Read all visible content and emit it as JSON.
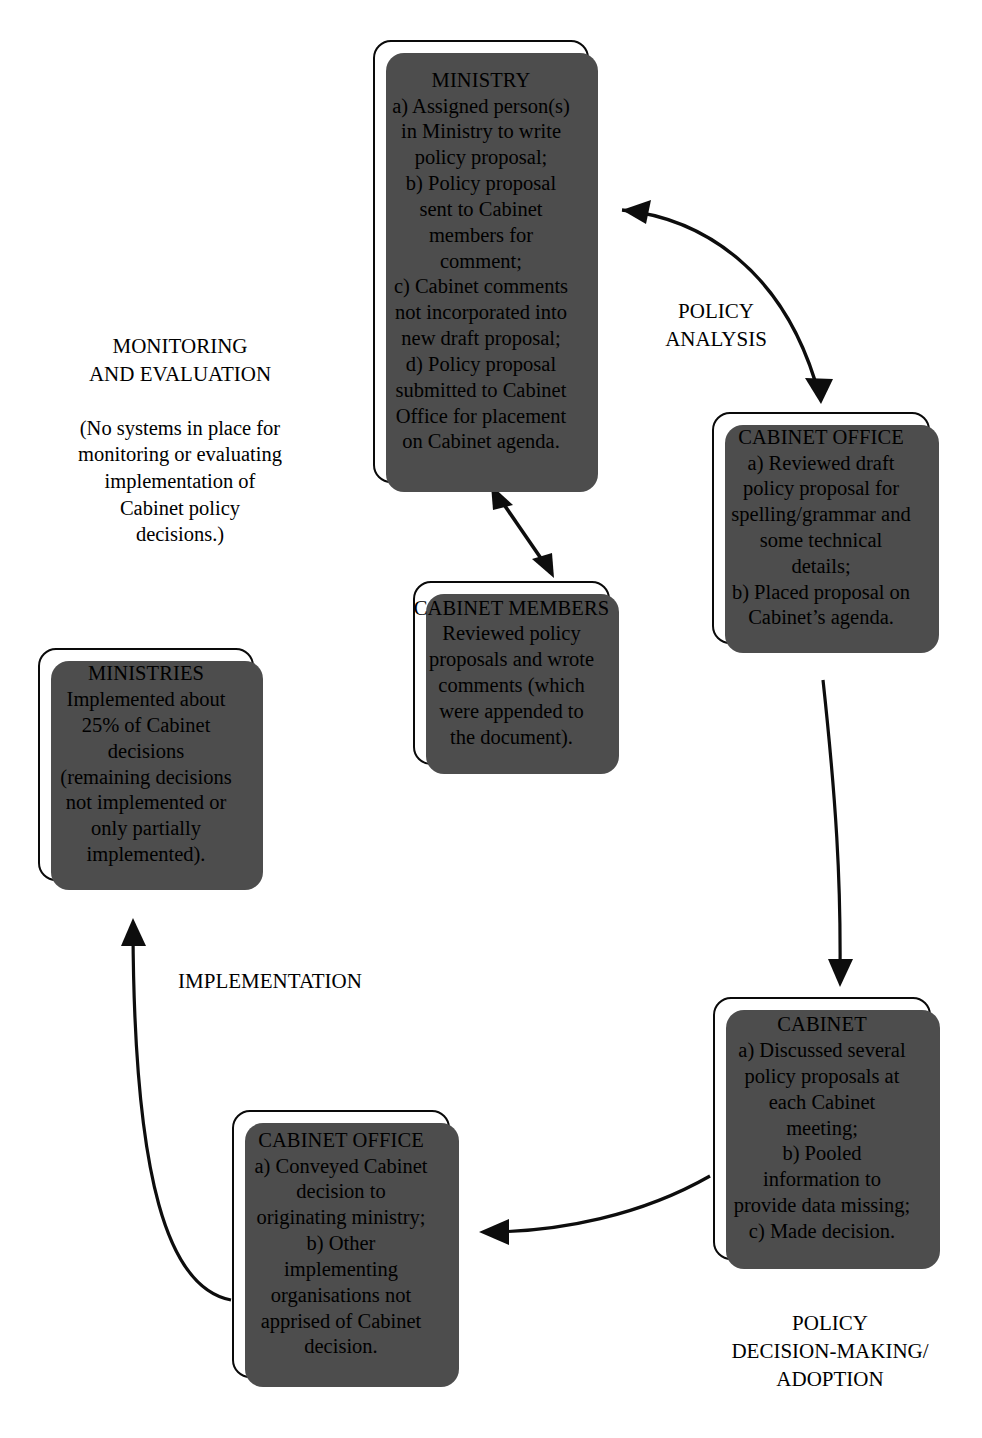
{
  "diagram": {
    "colors": {
      "ink": "#0a0a0a",
      "shadow": "#4d4d4d",
      "background": "#ffffff"
    }
  },
  "nodes": {
    "ministry": {
      "title": "MINISTRY",
      "lines": [
        "a) Assigned person(s)",
        "in Ministry to write",
        "policy proposal;",
        "b) Policy proposal",
        "sent to Cabinet",
        "members for",
        "comment;",
        "c) Cabinet comments",
        "not incorporated into",
        "new draft proposal;",
        "d) Policy proposal",
        "submitted to Cabinet",
        "Office for placement",
        "on Cabinet agenda."
      ]
    },
    "cabinet_office_top": {
      "title": "CABINET OFFICE",
      "lines": [
        "a) Reviewed draft",
        "policy proposal for",
        "spelling/grammar and",
        "some technical",
        "details;",
        "b) Placed proposal on",
        "Cabinet’s agenda."
      ]
    },
    "cabinet_members": {
      "title": "CABINET MEMBERS",
      "lines": [
        "Reviewed policy",
        "proposals and wrote",
        "comments (which",
        "were appended to",
        "the document)."
      ]
    },
    "ministries": {
      "title": "MINISTRIES",
      "lines": [
        "Implemented about",
        "25% of Cabinet",
        "decisions",
        "(remaining decisions",
        "not implemented or",
        "only partially",
        "implemented)."
      ]
    },
    "cabinet": {
      "title": "CABINET",
      "lines": [
        "a) Discussed several",
        "policy proposals at",
        "each Cabinet",
        "meeting;",
        "b) Pooled",
        "information to",
        "provide data missing;",
        "c) Made decision."
      ]
    },
    "cabinet_office_bottom": {
      "title": "CABINET OFFICE",
      "lines": [
        "a) Conveyed Cabinet",
        "decision to",
        "originating ministry;",
        "b) Other",
        "implementing",
        "organisations not",
        "apprised of Cabinet",
        "decision."
      ]
    }
  },
  "captions": {
    "monitoring": {
      "heading": [
        "MONITORING",
        "AND EVALUATION"
      ],
      "note": [
        "(No systems in place for",
        "monitoring or evaluating",
        "implementation of",
        "Cabinet policy",
        "decisions.)"
      ]
    },
    "policy_analysis": {
      "lines": [
        "POLICY",
        "ANALYSIS"
      ]
    },
    "implementation": {
      "lines": [
        "IMPLEMENTATION"
      ]
    },
    "policy_decision": {
      "lines": [
        "POLICY",
        "DECISION-MAKING/",
        "ADOPTION"
      ]
    }
  },
  "connectors": [
    {
      "name": "ministry-to-cabinet-office",
      "from": "ministry",
      "to": "cabinet_office_top",
      "heads": "both",
      "style": "curved"
    },
    {
      "name": "ministry-to-cabinet-members",
      "from": "ministry",
      "to": "cabinet_members",
      "heads": "both",
      "style": "straight"
    },
    {
      "name": "cabinet-office-to-cabinet",
      "from": "cabinet_office_top",
      "to": "cabinet",
      "heads": "end",
      "style": "curved"
    },
    {
      "name": "cabinet-to-cabinet-office-bottom",
      "from": "cabinet",
      "to": "cabinet_office_bottom",
      "heads": "end",
      "style": "curved"
    },
    {
      "name": "cabinet-office-bottom-to-ministries",
      "from": "cabinet_office_bottom",
      "to": "ministries",
      "heads": "end",
      "style": "curved"
    }
  ]
}
